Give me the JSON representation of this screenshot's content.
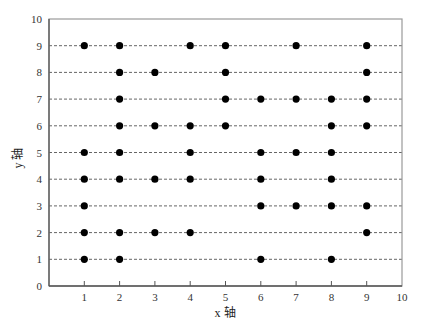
{
  "chart_data": {
    "type": "scatter",
    "title": "",
    "xlabel": "x 轴",
    "ylabel": "y 轴",
    "xlim": [
      0,
      10
    ],
    "ylim": [
      0,
      10
    ],
    "xticks": [
      "1",
      "2",
      "3",
      "4",
      "5",
      "6",
      "7",
      "8",
      "9",
      "10"
    ],
    "yticks": [
      "0",
      "1",
      "2",
      "3",
      "4",
      "5",
      "6",
      "7",
      "8",
      "9",
      "10"
    ],
    "grid": "horizontal dashed lines at y=1..9",
    "legend": null,
    "series": [
      {
        "name": "points",
        "points": [
          [
            1,
            9
          ],
          [
            2,
            9
          ],
          [
            4,
            9
          ],
          [
            5,
            9
          ],
          [
            7,
            9
          ],
          [
            9,
            9
          ],
          [
            2,
            8
          ],
          [
            3,
            8
          ],
          [
            5,
            8
          ],
          [
            9,
            8
          ],
          [
            2,
            7
          ],
          [
            5,
            7
          ],
          [
            6,
            7
          ],
          [
            7,
            7
          ],
          [
            8,
            7
          ],
          [
            9,
            7
          ],
          [
            2,
            6
          ],
          [
            3,
            6
          ],
          [
            4,
            6
          ],
          [
            5,
            6
          ],
          [
            8,
            6
          ],
          [
            9,
            6
          ],
          [
            1,
            5
          ],
          [
            2,
            5
          ],
          [
            4,
            5
          ],
          [
            6,
            5
          ],
          [
            7,
            5
          ],
          [
            8,
            5
          ],
          [
            1,
            4
          ],
          [
            2,
            4
          ],
          [
            3,
            4
          ],
          [
            4,
            4
          ],
          [
            6,
            4
          ],
          [
            8,
            4
          ],
          [
            1,
            3
          ],
          [
            6,
            3
          ],
          [
            7,
            3
          ],
          [
            8,
            3
          ],
          [
            9,
            3
          ],
          [
            1,
            2
          ],
          [
            2,
            2
          ],
          [
            3,
            2
          ],
          [
            4,
            2
          ],
          [
            9,
            2
          ],
          [
            1,
            1
          ],
          [
            2,
            1
          ],
          [
            6,
            1
          ],
          [
            8,
            1
          ]
        ]
      }
    ],
    "colors": {
      "point": "#000000",
      "grid": "#555555",
      "axis": "#555555",
      "frame": "#999999"
    }
  }
}
